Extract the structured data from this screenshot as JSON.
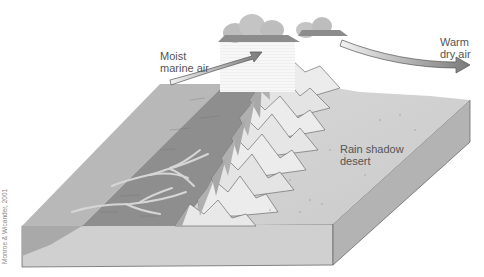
{
  "diagram": {
    "labels": {
      "moist_air": "Moist\nmarine air",
      "warm_dry_air": "Warm\ndry air",
      "rain_shadow": "Rain shadow\ndesert"
    },
    "credit": "Monroe & Wicander, 2001",
    "colors": {
      "ocean_top": "#b4b4b4",
      "windward_land": "#8c8c8c",
      "desert": "#d4d4d4",
      "block_front": "#cfcfcf",
      "block_side": "#b0b0b0",
      "cloud": "#a8a8a8",
      "arrow": "#8a8a8a",
      "mountain": "#eaeaea"
    }
  }
}
